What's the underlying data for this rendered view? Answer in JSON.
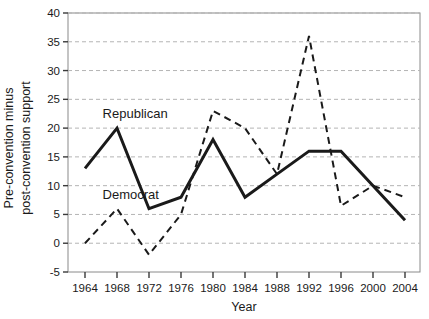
{
  "chart_data": {
    "type": "line",
    "title": "",
    "xlabel": "Year",
    "ylabel": "Pre-convention minus post-convention support",
    "ylabel_line1": "Pre-convention minus",
    "ylabel_line2": "post-convention support",
    "x": [
      1964,
      1968,
      1972,
      1976,
      1980,
      1984,
      1988,
      1992,
      1996,
      2000,
      2004
    ],
    "categories": [
      "1964",
      "1968",
      "1972",
      "1976",
      "1980",
      "1984",
      "1988",
      "1992",
      "1996",
      "2000",
      "2004"
    ],
    "xlim": [
      1962,
      2006
    ],
    "ylim": [
      -5,
      40
    ],
    "yticks": [
      -5,
      0,
      5,
      10,
      15,
      20,
      25,
      30,
      35,
      40
    ],
    "ytick_labels": [
      "-5",
      "0",
      "5",
      "10",
      "15",
      "20",
      "25",
      "30",
      "35",
      "40"
    ],
    "grid": true,
    "grid_color": "#b4b4b4",
    "legend": "inline-annotations",
    "series": [
      {
        "name": "Republican",
        "style": "solid",
        "color": "#1a1a1a",
        "width": 3,
        "values": [
          13,
          20,
          6,
          8,
          18,
          8,
          12,
          16,
          16,
          10,
          4
        ]
      },
      {
        "name": "Democrat",
        "style": "dashed",
        "color": "#1a1a1a",
        "width": 2,
        "values": [
          0,
          6,
          -2,
          5,
          23,
          20,
          12,
          36,
          6.5,
          10,
          8
        ]
      }
    ],
    "annotations": [
      {
        "text": "Republican",
        "x": 1966.2,
        "y": 21.8
      },
      {
        "text": "Democrat",
        "x": 1966.2,
        "y": 7.6
      }
    ]
  }
}
